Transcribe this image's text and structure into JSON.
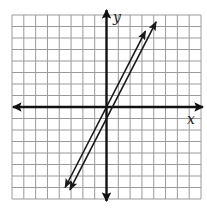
{
  "chart_data": {
    "type": "line",
    "title": "",
    "xlabel": "x",
    "ylabel": "y",
    "xlim": [
      -8,
      8
    ],
    "ylim": [
      -8,
      8
    ],
    "grid": true,
    "grid_step": 1,
    "tick_labels": false,
    "legend": null,
    "series": [
      {
        "name": "line-1",
        "equation": "y = 2x",
        "slope": 2,
        "intercept": 0,
        "x": [
          -3.5,
          3.3
        ],
        "y": [
          -7,
          6.6
        ],
        "arrows": "both"
      },
      {
        "name": "line-2",
        "equation": "y = 2x - 1",
        "slope": 2,
        "intercept": -1,
        "x": [
          -3.1,
          4.2
        ],
        "y": [
          -7.2,
          7.4
        ],
        "arrows": "both"
      }
    ]
  },
  "labels": {
    "x_axis": "x",
    "y_axis": "y"
  },
  "colors": {
    "grid": "#9a9a9a",
    "axes": "#111111",
    "lines": "#1a1a1a",
    "background": "#ffffff"
  }
}
